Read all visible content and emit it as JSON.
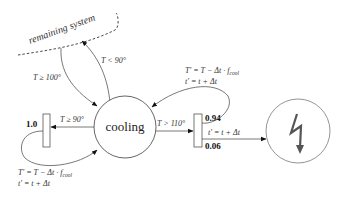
{
  "diagram": {
    "boundary": {
      "label": "remaining system"
    },
    "nodes": {
      "cooling": {
        "label": "cooling"
      },
      "failure": {
        "icon": "lightning-bolt-icon"
      }
    },
    "branch_left": {
      "probability": "1.0"
    },
    "branch_right": {
      "probability_top": "0.94",
      "probability_bottom": "0.06"
    },
    "edges": {
      "to_system": "T < 90°",
      "from_system": "T ≥ 100°",
      "to_left_branch": "T ≥ 90°",
      "to_right_branch": "T > 110°",
      "right_to_failure": "t′ = t + Δt"
    },
    "updates": {
      "left": {
        "line1": "T′ = T − Δt · f",
        "sub1": "cool",
        "line2": "t′ = t + Δt"
      },
      "right": {
        "line1": "T′ = T − Δt · f",
        "sub1": "cool",
        "line2": "t′ = t + Δt"
      }
    },
    "colors": {
      "stroke": "#555555",
      "text": "#333333",
      "arrow": "#111111"
    }
  }
}
